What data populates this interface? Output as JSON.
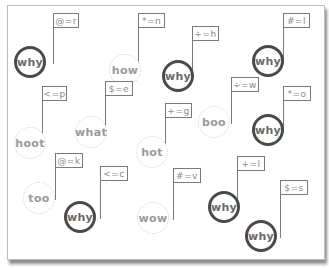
{
  "diagram": {
    "nodes": [
      {
        "word": "why",
        "style": "strong",
        "flag": "@=r",
        "cx": 30,
        "cy": 62,
        "fx": 53,
        "fy": 13,
        "fw": 26
      },
      {
        "word": "how",
        "style": "weak",
        "flag": "*=n",
        "cx": 125,
        "cy": 70,
        "fx": 138,
        "fy": 13,
        "fw": 27
      },
      {
        "word": "why",
        "style": "strong",
        "flag": "÷=h",
        "cx": 178,
        "cy": 76,
        "fx": 192,
        "fy": 26,
        "fw": 27
      },
      {
        "word": "why",
        "style": "strong",
        "flag": "#=l",
        "cx": 268,
        "cy": 61,
        "fx": 283,
        "fy": 13,
        "fw": 27
      },
      {
        "word": "hoot",
        "style": "weak",
        "flag": "<=p",
        "cx": 30,
        "cy": 143,
        "fx": 42,
        "fy": 86,
        "fw": 25
      },
      {
        "word": "what",
        "style": "weak",
        "flag": "$=e",
        "cx": 91,
        "cy": 132,
        "fx": 105,
        "fy": 81,
        "fw": 28
      },
      {
        "word": "boo",
        "style": "weak",
        "flag": "÷=w",
        "cx": 214,
        "cy": 122,
        "fx": 231,
        "fy": 77,
        "fw": 28
      },
      {
        "word": "why",
        "style": "strong",
        "flag": "*=o",
        "cx": 268,
        "cy": 130,
        "fx": 283,
        "fy": 86,
        "fw": 28
      },
      {
        "word": "hot",
        "style": "weak",
        "flag": "+=g",
        "cx": 152,
        "cy": 152,
        "fx": 165,
        "fy": 103,
        "fw": 27
      },
      {
        "word": "too",
        "style": "weak",
        "flag": "@=k",
        "cx": 39,
        "cy": 198,
        "fx": 55,
        "fy": 153,
        "fw": 28
      },
      {
        "word": "why",
        "style": "strong",
        "flag": "<=c",
        "cx": 80,
        "cy": 217,
        "fx": 100,
        "fy": 166,
        "fw": 28
      },
      {
        "word": "wow",
        "style": "weak",
        "flag": "#=v",
        "cx": 153,
        "cy": 218,
        "fx": 173,
        "fy": 168,
        "fw": 28
      },
      {
        "word": "why",
        "style": "strong",
        "flag": "+=l",
        "cx": 224,
        "cy": 207,
        "fx": 237,
        "fy": 156,
        "fw": 28
      },
      {
        "word": "why",
        "style": "strong",
        "flag": "$=s",
        "cx": 261,
        "cy": 236,
        "fx": 280,
        "fy": 180,
        "fw": 28
      }
    ]
  }
}
